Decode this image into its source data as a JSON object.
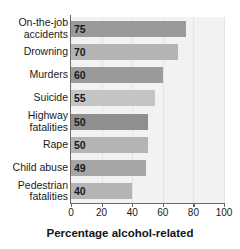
{
  "chart_data": {
    "type": "bar",
    "orientation": "horizontal",
    "title": "",
    "xlabel": "Percentage alcohol-related",
    "ylabel": "",
    "xlim": [
      0,
      100
    ],
    "xticks": [
      0,
      20,
      40,
      60,
      80,
      100
    ],
    "grid": true,
    "legend": false,
    "categories": [
      "On-the-job accidents",
      "Drowning",
      "Murders",
      "Suicide",
      "Highway fatalities",
      "Rape",
      "Child abuse",
      "Pedestrian fatalities"
    ],
    "values": [
      75,
      70,
      60,
      55,
      50,
      50,
      49,
      40
    ],
    "value_labels": [
      "75",
      "70",
      "60",
      "55",
      "50",
      "50",
      "49",
      "40"
    ],
    "bar_colors": [
      "#9a9a9a",
      "#b4b4b4",
      "#9a9a9a",
      "#c4c4c4",
      "#8f8f8f",
      "#b4b4b4",
      "#a6a6a6",
      "#b4b4b4"
    ]
  },
  "colors": {
    "plot_background": "#f2f2f2",
    "page_background": "#ffffff",
    "axis": "#6a6a6a",
    "gridline": "#e4e4e4",
    "text": "#1a1a1a"
  }
}
